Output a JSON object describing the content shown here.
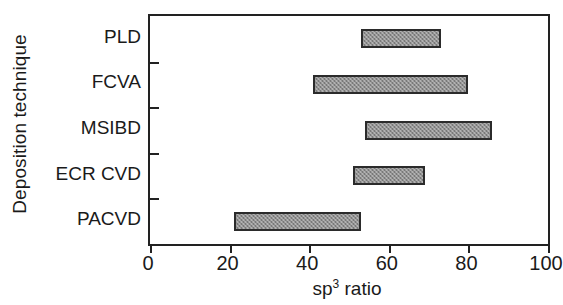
{
  "chart_data": {
    "type": "bar",
    "orientation": "horizontal",
    "style": "range-bar",
    "title": "",
    "xlabel_text": "sp",
    "xlabel_sup": "3",
    "xlabel_tail": " ratio",
    "xlabel": "sp3 ratio",
    "ylabel": "Deposition technique",
    "categories": [
      "PLD",
      "FCVA",
      "MSIBD",
      "ECR CVD",
      "PACVD"
    ],
    "ranges": [
      {
        "category": "PLD",
        "start": 53,
        "end": 73
      },
      {
        "category": "FCVA",
        "start": 41,
        "end": 80
      },
      {
        "category": "MSIBD",
        "start": 54,
        "end": 86
      },
      {
        "category": "ECR CVD",
        "start": 51,
        "end": 69
      },
      {
        "category": "PACVD",
        "start": 21,
        "end": 53
      }
    ],
    "xlim": [
      0,
      100
    ],
    "xticks": [
      0,
      20,
      40,
      60,
      80,
      100
    ],
    "xticklabels": [
      "0",
      "20",
      "40",
      "60",
      "80",
      "100"
    ],
    "grid": false,
    "legend": false,
    "bar_fill_color": "#909090",
    "bar_edge_color": "#2b2b2b",
    "axis_color": "#222222",
    "background_color": "#ffffff"
  }
}
